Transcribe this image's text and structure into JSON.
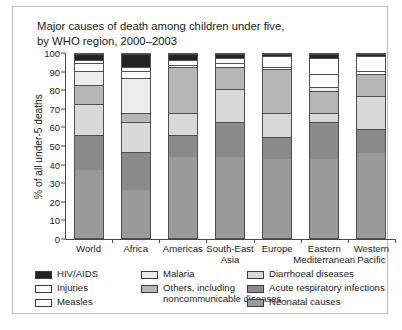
{
  "title": {
    "line1": "Major causes of death among children under five,",
    "line2": "by WHO region, 2000–2003"
  },
  "axes": {
    "ylabel": "% of all under-5 deaths",
    "yticks": [
      "100",
      "90",
      "80",
      "70",
      "60",
      "50",
      "40",
      "30",
      "20",
      "10",
      "0"
    ]
  },
  "legend": {
    "columns": [
      {
        "items": [
          {
            "label": "HIV/AIDS",
            "color": "#232323"
          },
          {
            "label": "Injuries",
            "color": "#ffffff"
          },
          {
            "label": "Measles",
            "color": "#ffffff"
          }
        ]
      },
      {
        "items": [
          {
            "label": "Malaria",
            "color": "#ececec"
          },
          {
            "label": "Others, including\n  noncommunicable diseases",
            "color": "#b6b6b6"
          }
        ]
      },
      {
        "items": [
          {
            "label": "Diarrhoeal diseases",
            "color": "#d8d8d8"
          },
          {
            "label": "Acute respiratory infections",
            "color": "#8a8a8a"
          },
          {
            "label": "Neonatal causes",
            "color": "#9a9a9a"
          }
        ]
      }
    ]
  },
  "chart_data": {
    "type": "bar",
    "subtype": "stacked-bar-100",
    "title": "Major causes of death among children under five, by WHO region, 2000–2003",
    "xlabel": "",
    "ylabel": "% of all under-5 deaths",
    "ylim": [
      0,
      100
    ],
    "ytick_step": 10,
    "grid": false,
    "legend_position": "bottom",
    "categories": [
      "World",
      "Africa",
      "Americas",
      "South-East\nAsia",
      "Europe",
      "Eastern\nMediterranean",
      "Western\nPacific"
    ],
    "series": [
      {
        "name": "Neonatal causes",
        "color": "#9a9a9a",
        "values": [
          37,
          26,
          44,
          44,
          43,
          43,
          46
        ]
      },
      {
        "name": "Acute respiratory infections",
        "color": "#8a8a8a",
        "values": [
          19,
          21,
          12,
          19,
          12,
          20,
          13
        ]
      },
      {
        "name": "Diarrhoeal diseases",
        "color": "#d8d8d8",
        "values": [
          17,
          16,
          12,
          18,
          13,
          5,
          18
        ]
      },
      {
        "name": "Others, including noncommunicable diseases",
        "color": "#b6b6b6",
        "values": [
          10,
          5,
          25,
          12,
          24,
          12,
          12
        ]
      },
      {
        "name": "Malaria",
        "color": "#ececec",
        "values": [
          8,
          19,
          0,
          0,
          0,
          2,
          0
        ]
      },
      {
        "name": "Measles",
        "color": "#ffffff",
        "values": [
          4,
          4,
          1,
          2,
          1,
          7,
          2
        ]
      },
      {
        "name": "Injuries",
        "color": "#ffffff",
        "values": [
          2,
          2,
          3,
          3,
          6,
          9,
          8
        ]
      },
      {
        "name": "HIV/AIDS",
        "color": "#232323",
        "values": [
          3,
          7,
          3,
          2,
          1,
          2,
          1
        ]
      }
    ]
  }
}
